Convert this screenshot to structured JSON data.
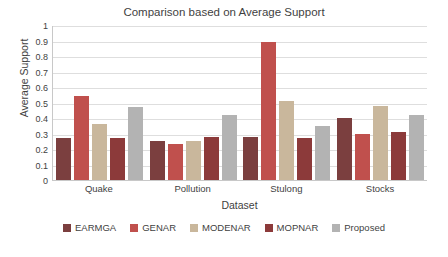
{
  "chart_data": {
    "type": "bar",
    "title": "Comparison based on Average Support",
    "xlabel": "Dataset",
    "ylabel": "Average Support",
    "categories": [
      "Quake",
      "Pollution",
      "Stulong",
      "Stocks"
    ],
    "ylim": [
      0,
      1
    ],
    "yticks": [
      0,
      0.1,
      0.2,
      0.3,
      0.4,
      0.5,
      0.6,
      0.7,
      0.8,
      0.9,
      1
    ],
    "ytick_labels": [
      "0",
      "0.1",
      "0.2",
      "0.3",
      "0.4",
      "0.5",
      "0.6",
      "0.7",
      "0.8",
      "0.9",
      "1"
    ],
    "grid": true,
    "legend_position": "bottom",
    "series": [
      {
        "name": "EARMGA",
        "color": "#7b3f3f",
        "values": [
          0.27,
          0.25,
          0.28,
          0.4
        ]
      },
      {
        "name": "GENAR",
        "color": "#c0504d",
        "values": [
          0.54,
          0.23,
          0.89,
          0.3
        ]
      },
      {
        "name": "MODENAR",
        "color": "#c9b79c",
        "values": [
          0.36,
          0.25,
          0.51,
          0.48
        ]
      },
      {
        "name": "MOPNAR",
        "color": "#8c3a3a",
        "values": [
          0.27,
          0.28,
          0.27,
          0.31
        ]
      },
      {
        "name": "Proposed",
        "color": "#b3b3b3",
        "values": [
          0.47,
          0.42,
          0.35,
          0.42
        ]
      }
    ]
  }
}
